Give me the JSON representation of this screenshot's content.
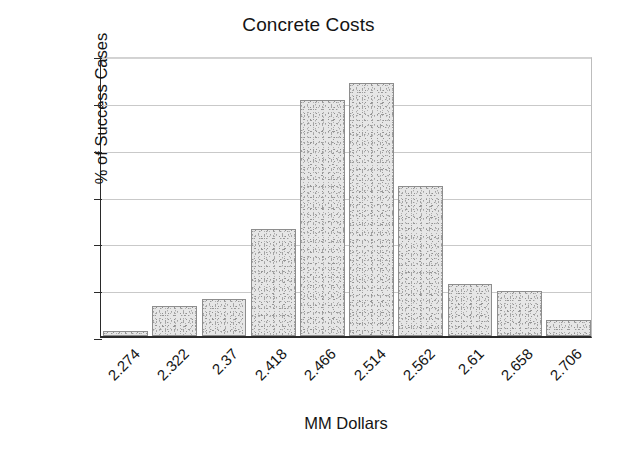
{
  "chart_data": {
    "type": "bar",
    "title": "Concrete Costs",
    "xlabel": "MM Dollars",
    "ylabel": "% of Success Cases",
    "categories": [
      "2.274",
      "2.322",
      "2.37",
      "2.418",
      "2.466",
      "2.514",
      "2.562",
      "2.61",
      "2.658",
      "2.706"
    ],
    "values": [
      0.5,
      3.2,
      4.0,
      11.4,
      25.2,
      27.0,
      16.0,
      5.6,
      4.8,
      1.7
    ],
    "ylim": [
      0,
      30
    ],
    "yticks": [
      0,
      5,
      10,
      15,
      20,
      25,
      30
    ],
    "ytick_labels": [
      "0",
      "5",
      "10",
      "15",
      "20",
      "25",
      "30"
    ],
    "grid": true,
    "legend": "none",
    "series_name": "% of Success Cases",
    "bar_fill_color": "#e6e6e6",
    "bar_edge_color": "#8e8e8e",
    "axis_color": "#2a2a2a",
    "grid_color": "#c9c9c9",
    "text_color": "#141414",
    "background_color": "#ffffff"
  }
}
